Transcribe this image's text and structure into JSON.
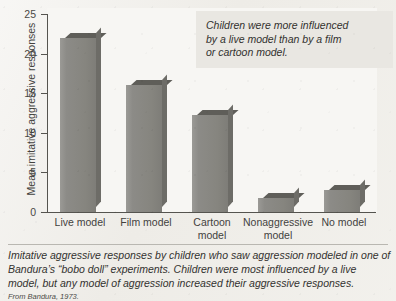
{
  "chart_data": {
    "type": "bar",
    "title": "",
    "xlabel": "",
    "ylabel": "Mean imitative aggressive responses",
    "ylim": [
      0,
      25
    ],
    "yticks": [
      0,
      5,
      10,
      15,
      20,
      25
    ],
    "grid": false,
    "legend": "none",
    "categories": [
      "Live model",
      "Film model",
      "Cartoon model",
      "Nonaggressive model",
      "No model"
    ],
    "category_lines": [
      [
        "Live model"
      ],
      [
        "Film model"
      ],
      [
        "Cartoon",
        "model"
      ],
      [
        "Nonaggressive",
        "model"
      ],
      [
        "No model"
      ]
    ],
    "values": [
      22,
      16,
      12.3,
      1.8,
      2.8
    ],
    "annotations": [
      "Children were more influenced",
      "by a live model than by a film",
      "or cartoon model."
    ]
  },
  "caption": {
    "lines": [
      "Imitative aggressive responses by children who saw aggression modeled in one of",
      "Bandura’s “bobo doll” experiments. Children were most influenced by a live",
      "model, but any model of aggression increased their aggressive responses."
    ],
    "source": "From Bandura, 1973."
  },
  "colors": {
    "bar_face": "#8a8984",
    "bar_top": "#5f5e59",
    "bar_side": "#6d6c67",
    "panel_background": "#f7f6f3",
    "page_background": "#eeece7",
    "axis": "#55544f",
    "callout_background": "#e9e7e2",
    "text": "#33322f"
  }
}
